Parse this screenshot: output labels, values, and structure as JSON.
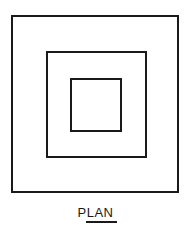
{
  "diagram": {
    "type": "plan-view",
    "shapes": [
      {
        "name": "outer-square",
        "x": 11,
        "y": 15,
        "width": 168,
        "height": 178
      },
      {
        "name": "middle-square",
        "x": 46,
        "y": 51,
        "width": 101,
        "height": 107
      },
      {
        "name": "inner-square",
        "x": 70,
        "y": 78,
        "width": 52,
        "height": 54
      }
    ],
    "label": "PLAN",
    "line_color": "#1a1a1a"
  }
}
